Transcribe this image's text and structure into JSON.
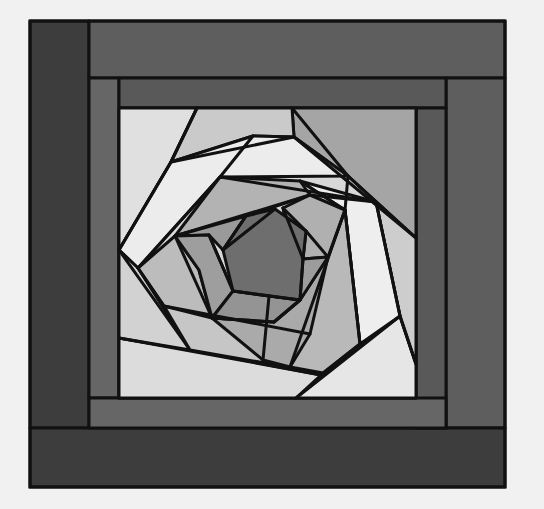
{
  "figure": {
    "type": "quilt-block-diagram",
    "background": "#f1f1f1",
    "outline_color": "#111111",
    "outline_width": 3
  },
  "palette": {
    "border_darkest": "#3d3d3d",
    "border_dark": "#595959",
    "border_mid": "#5e5e5e",
    "frame_inner": "#666666",
    "center_darkest": "#6c6c6c",
    "gray_1": "#8c8c8c",
    "gray_2": "#9d9d9d",
    "gray_3": "#adadad",
    "gray_4": "#bdbdbd",
    "gray_5": "#cbcbcb",
    "gray_6": "#d8d8d8",
    "gray_7": "#e8e8e8",
    "white": "#f0f0f0"
  },
  "borders": [
    {
      "name": "left-outer-strip",
      "points": "30,21 89,21 89,428 30,428",
      "fill": "#3d3d3d"
    },
    {
      "name": "top-outer-strip",
      "points": "89,21 505,21 505,78 89,78",
      "fill": "#5e5e5e"
    },
    {
      "name": "right-outer-strip",
      "points": "446,78 505,78 505,428 446,428",
      "fill": "#5e5e5e"
    },
    {
      "name": "bottom-outer-strip",
      "points": "30,428 505,428 505,487 30,487",
      "fill": "#3d3d3d"
    },
    {
      "name": "left-inner-strip",
      "points": "89,78 119,78 119,398 89,398",
      "fill": "#666666"
    },
    {
      "name": "top-inner-strip",
      "points": "119,78 446,78 446,108 119,108",
      "fill": "#595959"
    },
    {
      "name": "right-inner-strip",
      "points": "416,108 446,108 446,428 416,428",
      "fill": "#595959"
    },
    {
      "name": "bottom-inner-strip",
      "points": "89,398 446,398 446,428 89,428",
      "fill": "#666666"
    }
  ],
  "panes": [
    {
      "name": "center-square",
      "points": "119,108 416,108 416,398 119,398",
      "fill": "#d8d8d8"
    },
    {
      "name": "corner-top-left",
      "points": "119,108 197,108 171,162 119,250",
      "fill": "#e0e0e0"
    },
    {
      "name": "corner-top-right",
      "points": "292,108 416,108 416,238 376,202 348,176 294,137",
      "fill": "#a5a5a5"
    },
    {
      "name": "corner-bottom-right",
      "points": "416,398 296,398 323,373 400,316 416,364",
      "fill": "#e6e6e6"
    },
    {
      "name": "corner-bottom-left",
      "points": "119,398 119,338 190,350 321,375 296,398",
      "fill": "#dcdcdc"
    },
    {
      "name": "ring1-top",
      "points": "197,108 292,108 294,137 253,136 171,162",
      "fill": "#cacaca"
    },
    {
      "name": "ring1-top-white",
      "points": "171,162 253,136 294,137 348,176 220,177 138,268 119,250",
      "fill": "#ececec"
    },
    {
      "name": "ring1-right-light",
      "points": "348,176 376,202 400,316 416,364 416,238",
      "fill": "#cdcdcd"
    },
    {
      "name": "ring1-right-white",
      "points": "300,181 376,202 400,316 360,344 345,210",
      "fill": "#eeeeee"
    },
    {
      "name": "ring1-left",
      "points": "119,250 138,268 190,350 119,338",
      "fill": "#d2d2d2"
    },
    {
      "name": "ring1-bottom",
      "points": "164,306 310,334 360,344 323,373 190,350",
      "fill": "#c6c6c6"
    },
    {
      "name": "ring1-right-mid",
      "points": "345,210 360,344 323,373 290,367 328,257",
      "fill": "#b9b9b9"
    },
    {
      "name": "ring2-top",
      "points": "220,177 300,181 310,195 246,216 175,236",
      "fill": "#b3b3b3"
    },
    {
      "name": "ring2-right",
      "points": "310,195 345,210 328,257 303,259 283,208",
      "fill": "#b0b0b0"
    },
    {
      "name": "ring2-left",
      "points": "138,268 175,236 199,270 212,318 164,306",
      "fill": "#bcbcbc"
    },
    {
      "name": "ring2-bottom",
      "points": "212,318 274,322 300,300 328,257 310,334 290,367 263,360",
      "fill": "#aaaaaa"
    },
    {
      "name": "ring3-top",
      "points": "175,236 246,216 239,226 223,250 209,235",
      "fill": "#9a9a9a"
    },
    {
      "name": "ring3-left",
      "points": "175,236 209,235 233,291 212,318 199,270",
      "fill": "#9e9e9e"
    },
    {
      "name": "ring3-bottom",
      "points": "212,318 233,291 269,296 300,300 274,322",
      "fill": "#949494"
    },
    {
      "name": "ring3-right",
      "points": "303,259 328,257 300,300 283,208 306,231",
      "fill": "#9c9c9c"
    },
    {
      "name": "center-hexagon",
      "points": "223,250 246,216 275,209 306,231 303,259 300,300 269,296 233,291",
      "fill": "#6e6e6e"
    }
  ],
  "lines": [
    "197,108 171,162 119,250",
    "171,162 294,137",
    "253,136 220,177 138,268",
    "292,108 348,176 416,238",
    "220,177 376,202",
    "294,137 416,238",
    "348,176 345,210",
    "376,202 400,316 416,364",
    "310,195 376,202",
    "300,181 345,210 360,344",
    "345,210 290,367",
    "400,316 296,398",
    "119,338 321,375 360,344",
    "119,250 190,350",
    "138,268 164,306 310,334",
    "175,236 310,195",
    "175,236 212,318",
    "209,235 233,291",
    "246,216 223,250",
    "275,209 223,250",
    "212,318 274,322",
    "233,291 300,300",
    "269,296 263,360",
    "303,259 300,300",
    "306,231 328,257",
    "283,208 303,259",
    "300,300 274,322"
  ]
}
